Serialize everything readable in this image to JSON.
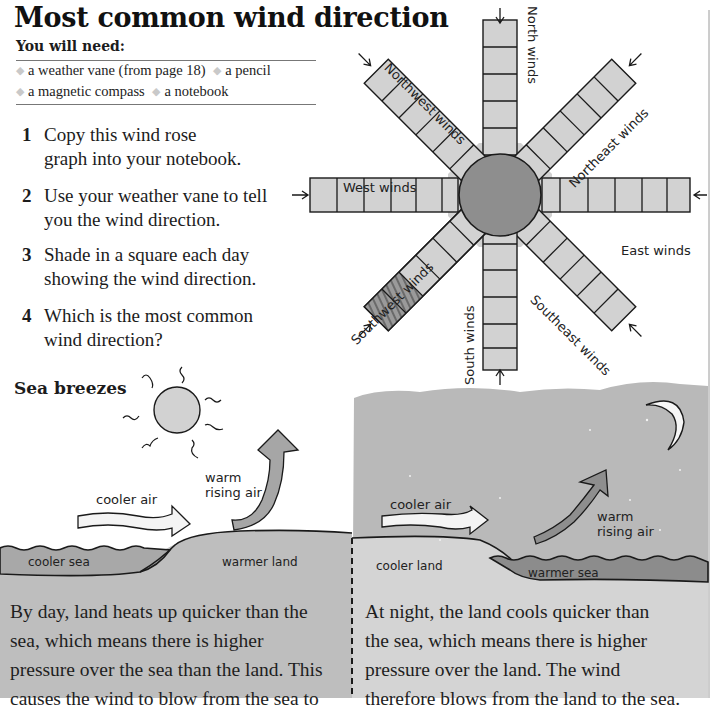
{
  "page": {
    "title": "Most common wind direction",
    "you_will_need": {
      "heading": "You will need:",
      "items": [
        "a weather vane (from page 18)",
        "a pencil",
        "a magnetic compass",
        "a notebook"
      ]
    },
    "steps": [
      {
        "number": "1",
        "text": "Copy this wind rose graph into your notebook."
      },
      {
        "number": "2",
        "text": "Use your weather vane to tell you the wind direction."
      },
      {
        "number": "3",
        "text": "Shade in a square each day showing the wind direction."
      },
      {
        "number": "4",
        "text": "Which is the most common wind direction?"
      }
    ],
    "wind_rose": {
      "arms": [
        {
          "label": "North winds",
          "squares": 6,
          "shaded": 0
        },
        {
          "label": "Northeast winds",
          "squares": 6,
          "shaded": 0
        },
        {
          "label": "East winds",
          "squares": 6,
          "shaded": 0
        },
        {
          "label": "Southeast winds",
          "squares": 6,
          "shaded": 0
        },
        {
          "label": "South winds",
          "squares": 6,
          "shaded": 0
        },
        {
          "label": "Southwest winds",
          "squares": 6,
          "shaded": 2
        },
        {
          "label": "West winds",
          "squares": 6,
          "shaded": 0
        },
        {
          "label": "Northwest winds",
          "squares": 6,
          "shaded": 0
        }
      ]
    },
    "sea_breezes": {
      "heading": "Sea breezes",
      "day": {
        "labels": {
          "cooler_air": "cooler air",
          "warm_rising_air_1": "warm",
          "warm_rising_air_2": "rising air",
          "sea": "cooler sea",
          "land": "warmer land"
        },
        "text_lines": [
          "By day, land heats up quicker than the",
          "sea, which means there is higher",
          "pressure over the sea than the land. This",
          "causes the wind to blow from the sea to"
        ]
      },
      "night": {
        "labels": {
          "cooler_air": "cooler air",
          "warm_rising_air_1": "warm",
          "warm_rising_air_2": "rising air",
          "land": "cooler land",
          "sea": "warmer sea"
        },
        "text_lines": [
          "At night, the land cools quicker than",
          "the sea, which means there is higher",
          "pressure over the land. The wind",
          "therefore blows from the land to the sea."
        ]
      }
    }
  },
  "colors": {
    "arm_fill": "#d2d2d2",
    "center_fill": "#8e8e8e",
    "night_sky": "#b7b7b7",
    "day_land": "#bdbdbd",
    "day_sea": "#a9a9a9",
    "night_sea": "#8a8a8a",
    "night_land": "#d6d6d6"
  }
}
